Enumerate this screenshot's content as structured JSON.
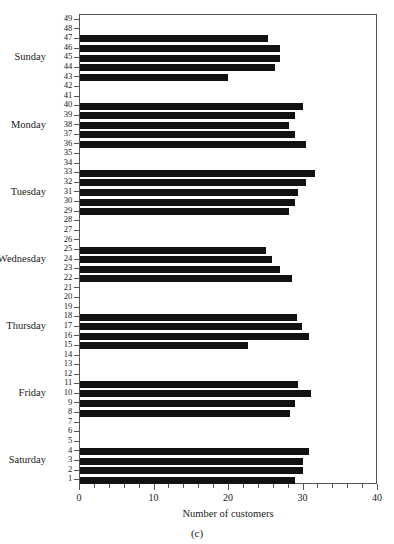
{
  "chart_data": {
    "type": "bar",
    "orientation": "horizontal",
    "title": "",
    "subtitle": "",
    "caption": "(c)",
    "xlabel": "Number of customers",
    "ylabel": "",
    "xlim": [
      0,
      40
    ],
    "xticks": [
      0,
      10,
      20,
      30,
      40
    ],
    "xtick_labels": [
      "0",
      "10",
      "20",
      "30",
      "40"
    ],
    "xminor_step": 2,
    "ylim": [
      0.5,
      49.5
    ],
    "yticks": [
      1,
      2,
      3,
      4,
      5,
      6,
      7,
      8,
      9,
      10,
      11,
      12,
      13,
      14,
      15,
      16,
      17,
      18,
      19,
      20,
      21,
      22,
      23,
      24,
      25,
      26,
      27,
      28,
      29,
      30,
      31,
      32,
      33,
      34,
      35,
      36,
      37,
      38,
      39,
      40,
      41,
      42,
      43,
      44,
      45,
      46,
      47,
      48,
      49
    ],
    "grid": false,
    "legend": null,
    "bar_color": "#111111",
    "frame_color": "#555555",
    "background": "#ffffff",
    "group_labels": [
      {
        "label": "Sunday",
        "tick": 45
      },
      {
        "label": "Monday",
        "tick": 38
      },
      {
        "label": "Tuesday",
        "tick": 31
      },
      {
        "label": "Wednesday",
        "tick": 24
      },
      {
        "label": "Thursday",
        "tick": 17
      },
      {
        "label": "Friday",
        "tick": 10
      },
      {
        "label": "Saturday",
        "tick": 3
      }
    ],
    "groups": [
      {
        "name": "Sunday",
        "points": [
          {
            "tick": 47,
            "value": 25.3
          },
          {
            "tick": 46,
            "value": 26.8
          },
          {
            "tick": 45,
            "value": 26.8
          },
          {
            "tick": 44,
            "value": 26.2
          },
          {
            "tick": 43,
            "value": 19.9
          }
        ]
      },
      {
        "name": "Monday",
        "points": [
          {
            "tick": 40,
            "value": 29.9
          },
          {
            "tick": 39,
            "value": 28.8
          },
          {
            "tick": 38,
            "value": 28.1
          },
          {
            "tick": 37,
            "value": 28.8
          },
          {
            "tick": 36,
            "value": 30.4
          }
        ]
      },
      {
        "name": "Tuesday",
        "points": [
          {
            "tick": 33,
            "value": 31.5
          },
          {
            "tick": 32,
            "value": 30.4
          },
          {
            "tick": 31,
            "value": 29.3
          },
          {
            "tick": 30,
            "value": 28.9
          },
          {
            "tick": 29,
            "value": 28.0
          }
        ]
      },
      {
        "name": "Wednesday",
        "points": [
          {
            "tick": 25,
            "value": 25.0
          },
          {
            "tick": 24,
            "value": 25.8
          },
          {
            "tick": 23,
            "value": 26.9
          },
          {
            "tick": 22,
            "value": 28.4
          }
        ]
      },
      {
        "name": "Thursday",
        "points": [
          {
            "tick": 18,
            "value": 29.1
          },
          {
            "tick": 17,
            "value": 29.8
          },
          {
            "tick": 16,
            "value": 30.7
          },
          {
            "tick": 15,
            "value": 22.5
          }
        ]
      },
      {
        "name": "Friday",
        "points": [
          {
            "tick": 11,
            "value": 29.3
          },
          {
            "tick": 10,
            "value": 31.0
          },
          {
            "tick": 9,
            "value": 28.9
          },
          {
            "tick": 8,
            "value": 28.2
          }
        ]
      },
      {
        "name": "Saturday",
        "points": [
          {
            "tick": 4,
            "value": 30.8
          },
          {
            "tick": 3,
            "value": 29.9
          },
          {
            "tick": 2,
            "value": 29.9
          },
          {
            "tick": 1,
            "value": 28.8
          }
        ]
      }
    ]
  }
}
